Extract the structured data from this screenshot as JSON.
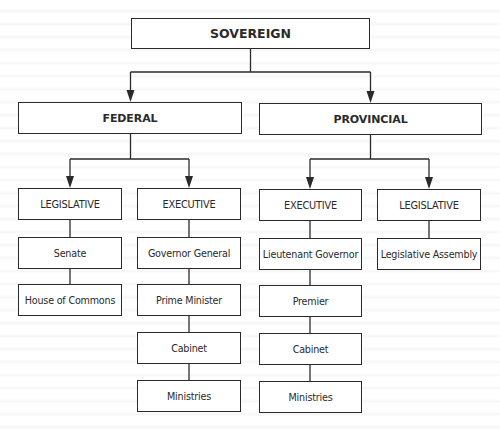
{
  "diagram": {
    "type": "org-chart",
    "root": {
      "label": "SOVEREIGN",
      "children": [
        "FEDERAL",
        "PROVINCIAL"
      ]
    },
    "federal": {
      "label": "FEDERAL",
      "legislative": {
        "label": "LEGISLATIVE",
        "chain": [
          "Senate",
          "House of Commons"
        ]
      },
      "executive": {
        "label": "EXECUTIVE",
        "chain": [
          "Governor General",
          "Prime Minister",
          "Cabinet",
          "Ministries"
        ]
      }
    },
    "provincial": {
      "label": "PROVINCIAL",
      "executive": {
        "label": "EXECUTIVE",
        "chain": [
          "Lieutenant Governor",
          "Premier",
          "Cabinet",
          "Ministries"
        ]
      },
      "legislative": {
        "label": "LEGISLATIVE",
        "chain": [
          "Legislative Assembly"
        ]
      }
    },
    "edges": [
      {
        "from": "SOVEREIGN",
        "to": "FEDERAL",
        "arrow": true
      },
      {
        "from": "SOVEREIGN",
        "to": "PROVINCIAL",
        "arrow": true
      },
      {
        "from": "FEDERAL",
        "to": "FEDERAL LEGISLATIVE",
        "arrow": true
      },
      {
        "from": "FEDERAL",
        "to": "FEDERAL EXECUTIVE",
        "arrow": true
      },
      {
        "from": "PROVINCIAL",
        "to": "PROVINCIAL EXECUTIVE",
        "arrow": true
      },
      {
        "from": "PROVINCIAL",
        "to": "PROVINCIAL LEGISLATIVE",
        "arrow": true
      },
      {
        "from": "FEDERAL LEGISLATIVE",
        "to": "Senate",
        "arrow": false
      },
      {
        "from": "Senate",
        "to": "House of Commons",
        "arrow": false
      },
      {
        "from": "FEDERAL EXECUTIVE",
        "to": "Governor General",
        "arrow": false
      },
      {
        "from": "Governor General",
        "to": "Prime Minister",
        "arrow": false
      },
      {
        "from": "Prime Minister",
        "to": "Cabinet",
        "arrow": false
      },
      {
        "from": "Cabinet",
        "to": "Ministries",
        "arrow": false
      },
      {
        "from": "PROVINCIAL EXECUTIVE",
        "to": "Lieutenant Governor",
        "arrow": false
      },
      {
        "from": "Lieutenant Governor",
        "to": "Premier",
        "arrow": false
      },
      {
        "from": "Premier",
        "to": "Cabinet",
        "arrow": false
      },
      {
        "from": "Cabinet",
        "to": "Ministries",
        "arrow": false
      },
      {
        "from": "PROVINCIAL LEGISLATIVE",
        "to": "Legislative Assembly",
        "arrow": false
      }
    ]
  },
  "colors": {
    "line": "#2a2a2a",
    "box_border": "#2a2a2a",
    "box_fill": "#ffffff",
    "background": "#ffffff"
  }
}
